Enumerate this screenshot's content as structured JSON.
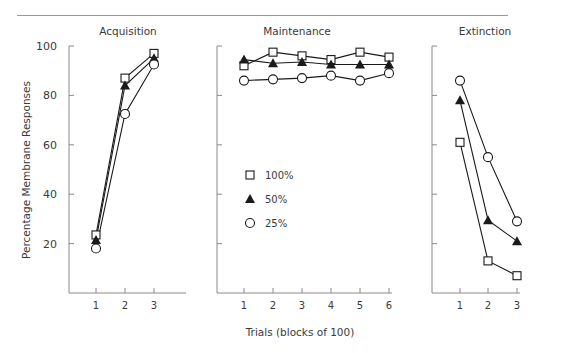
{
  "chart_data": {
    "type": "line",
    "ylabel": "Percentage Membrane Responses",
    "xlabel": "Trials (blocks of 100)",
    "ylim": [
      0,
      100
    ],
    "yticks": [
      20,
      40,
      60,
      80,
      100
    ],
    "grid": false,
    "legend": {
      "position": "inside Maintenance panel, left-center",
      "entries": [
        {
          "label": "100%",
          "marker": "open-square"
        },
        {
          "label": "50%",
          "marker": "filled-triangle"
        },
        {
          "label": "25%",
          "marker": "open-circle"
        }
      ]
    },
    "panels": [
      {
        "title": "Acquisition",
        "x": [
          1,
          2,
          3
        ],
        "series": [
          {
            "name": "100%",
            "marker": "open-square",
            "values": [
              23.5,
              87,
              97
            ]
          },
          {
            "name": "50%",
            "marker": "filled-triangle",
            "values": [
              21.5,
              84,
              95
            ]
          },
          {
            "name": "25%",
            "marker": "open-circle",
            "values": [
              18,
              72.5,
              92.5
            ]
          }
        ]
      },
      {
        "title": "Maintenance",
        "x": [
          1,
          2,
          3,
          4,
          5,
          6
        ],
        "series": [
          {
            "name": "100%",
            "marker": "open-square",
            "values": [
              92,
              97.5,
              96,
              94.5,
              97.5,
              95.5
            ]
          },
          {
            "name": "50%",
            "marker": "filled-triangle",
            "values": [
              94.5,
              93,
              93.5,
              92.5,
              92.5,
              92.5
            ]
          },
          {
            "name": "25%",
            "marker": "open-circle",
            "values": [
              86,
              86.5,
              87,
              88,
              86,
              89
            ]
          }
        ]
      },
      {
        "title": "Extinction",
        "x": [
          1,
          2,
          3
        ],
        "series": [
          {
            "name": "100%",
            "marker": "open-square",
            "values": [
              61,
              13,
              7
            ]
          },
          {
            "name": "50%",
            "marker": "filled-triangle",
            "values": [
              78,
              29.5,
              21
            ]
          },
          {
            "name": "25%",
            "marker": "open-circle",
            "values": [
              86,
              55,
              29
            ]
          }
        ]
      }
    ]
  }
}
